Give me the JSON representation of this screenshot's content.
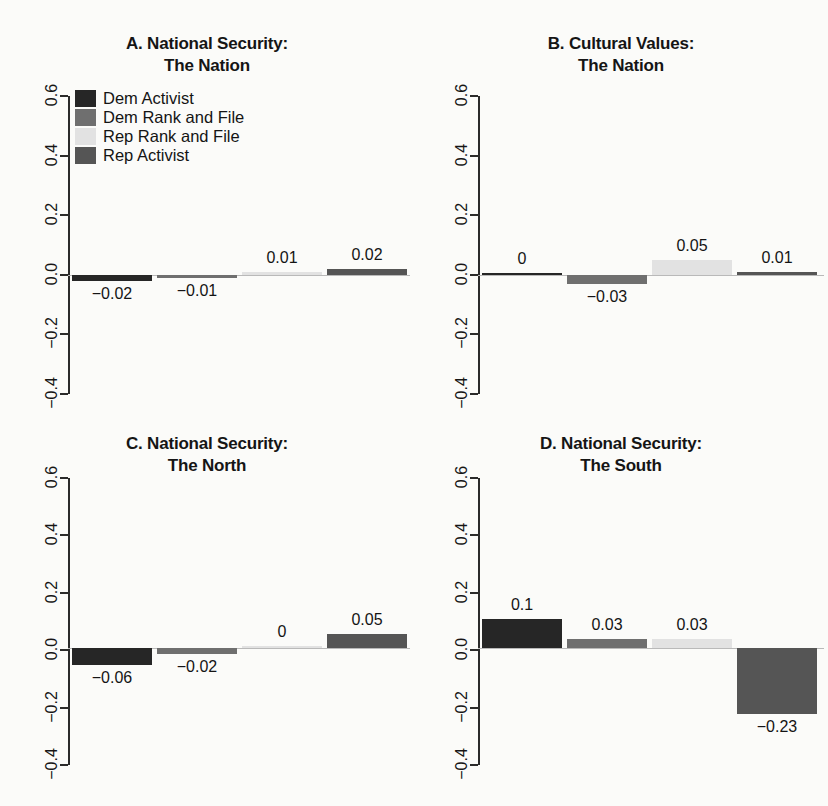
{
  "figure": {
    "background_color": "#fbfbf9",
    "zero_line_color": "#b9b9b9",
    "axis_color": "#2b2b2b"
  },
  "legend": {
    "entries": [
      {
        "label": "Dem Activist",
        "color": "#262626"
      },
      {
        "label": "Dem Rank and File",
        "color": "#6f6f6f"
      },
      {
        "label": "Rep Rank and File",
        "color": "#e2e2e2"
      },
      {
        "label": "Rep Activist",
        "color": "#555555"
      }
    ]
  },
  "chart_data": [
    {
      "type": "bar",
      "panel": "A",
      "title": "A. National Security:",
      "subtitle": "The Nation",
      "categories": [
        "Dem Activist",
        "Dem Rank and File",
        "Rep Rank and File",
        "Rep Activist"
      ],
      "values": [
        -0.02,
        -0.01,
        0.01,
        0.02
      ],
      "labels": [
        "−0.02",
        "−0.01",
        "0.01",
        "0.02"
      ],
      "colors": [
        "#262626",
        "#6f6f6f",
        "#e2e2e2",
        "#555555"
      ],
      "xlabel": "",
      "ylabel": "",
      "ylim": [
        -0.4,
        0.6
      ],
      "yticks": [
        0.6,
        0.4,
        0.2,
        0.0,
        -0.2,
        -0.4
      ],
      "ytick_labels": [
        "0.6",
        "0.4",
        "0.2",
        "0.0",
        "−0.2",
        "−0.4"
      ],
      "grid": false,
      "has_legend": true,
      "legend_position": "top-left"
    },
    {
      "type": "bar",
      "panel": "B",
      "title": "B. Cultural Values:",
      "subtitle": "The Nation",
      "categories": [
        "Dem Activist",
        "Dem Rank and File",
        "Rep Rank and File",
        "Rep Activist"
      ],
      "values": [
        0,
        -0.03,
        0.05,
        0.01
      ],
      "labels": [
        "0",
        "−0.03",
        "0.05",
        "0.01"
      ],
      "colors": [
        "#262626",
        "#6f6f6f",
        "#e2e2e2",
        "#555555"
      ],
      "xlabel": "",
      "ylabel": "",
      "ylim": [
        -0.4,
        0.6
      ],
      "yticks": [
        0.6,
        0.4,
        0.2,
        0.0,
        -0.2,
        -0.4
      ],
      "ytick_labels": [
        "0.6",
        "0.4",
        "0.2",
        "0.0",
        "−0.2",
        "−0.4"
      ],
      "grid": false,
      "has_legend": false
    },
    {
      "type": "bar",
      "panel": "C",
      "title": "C. National Security:",
      "subtitle": "The North",
      "categories": [
        "Dem Activist",
        "Dem Rank and File",
        "Rep Rank and File",
        "Rep Activist"
      ],
      "values": [
        -0.06,
        -0.02,
        0,
        0.05
      ],
      "labels": [
        "−0.06",
        "−0.02",
        "0",
        "0.05"
      ],
      "colors": [
        "#262626",
        "#6f6f6f",
        "#e2e2e2",
        "#555555"
      ],
      "xlabel": "",
      "ylabel": "",
      "ylim": [
        -0.4,
        0.6
      ],
      "yticks": [
        0.6,
        0.4,
        0.2,
        0.0,
        -0.2,
        -0.4
      ],
      "ytick_labels": [
        "0.6",
        "0.4",
        "0.2",
        "0.0",
        "−0.2",
        "−0.4"
      ],
      "grid": false,
      "has_legend": false
    },
    {
      "type": "bar",
      "panel": "D",
      "title": "D. National Security:",
      "subtitle": "The South",
      "categories": [
        "Dem Activist",
        "Dem Rank and File",
        "Rep Rank and File",
        "Rep Activist"
      ],
      "values": [
        0.1,
        0.03,
        0.03,
        -0.23
      ],
      "labels": [
        "0.1",
        "0.03",
        "0.03",
        "−0.23"
      ],
      "colors": [
        "#262626",
        "#6f6f6f",
        "#e2e2e2",
        "#555555"
      ],
      "xlabel": "",
      "ylabel": "",
      "ylim": [
        -0.4,
        0.6
      ],
      "yticks": [
        0.6,
        0.4,
        0.2,
        0.0,
        -0.2,
        -0.4
      ],
      "ytick_labels": [
        "0.6",
        "0.4",
        "0.2",
        "0.0",
        "−0.2",
        "−0.4"
      ],
      "grid": false,
      "has_legend": false
    }
  ]
}
